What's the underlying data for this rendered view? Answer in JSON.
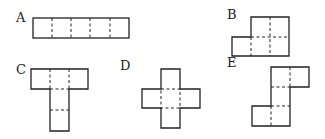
{
  "figure": {
    "square_size_px": 19,
    "labels": {
      "a": "A",
      "b": "B",
      "c": "C",
      "d": "D",
      "e": "E"
    },
    "nets": [
      {
        "label": "A",
        "squares": 5,
        "shape": "1x5 straight row"
      },
      {
        "label": "B",
        "squares": 5,
        "shape": "2x2 block with one extra square on lower left"
      },
      {
        "label": "C",
        "squares": 5,
        "shape": "T shape: row of 3 on top, column of 2 below middle"
      },
      {
        "label": "D",
        "squares": 5,
        "shape": "plus / cross shape"
      },
      {
        "label": "E",
        "squares": 5,
        "shape": "staircase: 2 on top right, 1 middle, 2 on bottom left"
      }
    ],
    "colors": {
      "line": "#222222",
      "background": "#ffffff"
    }
  }
}
